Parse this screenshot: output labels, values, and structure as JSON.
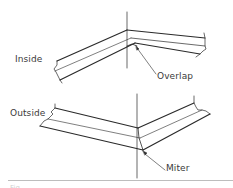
{
  "figure": {
    "type": "technical-diagram",
    "panels": [
      {
        "label": "Inside",
        "annotation": "Overlap"
      },
      {
        "label": "Outside",
        "annotation": "Miter"
      }
    ],
    "caption_truncated": "Fig."
  },
  "colors": {
    "line": "#2a2a2a",
    "text": "#3a3a3a",
    "rule": "#bdbdbd"
  }
}
